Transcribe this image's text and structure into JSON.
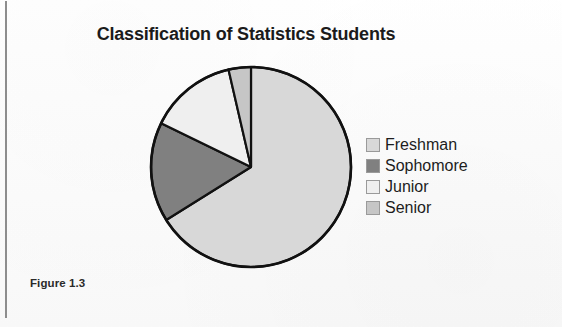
{
  "figure": {
    "caption": "Figure 1.3"
  },
  "chart_data": {
    "type": "pie",
    "title": "Classification of Statistics Students",
    "xlabel": "",
    "ylabel": "",
    "legend_position": "right",
    "grid": false,
    "start_angle_deg": 0,
    "direction": "clockwise",
    "categories": [
      "Freshman",
      "Sophomore",
      "Junior",
      "Senior"
    ],
    "values": [
      66.1,
      16.1,
      14.2,
      3.6
    ],
    "units": "percent",
    "slice_angles_deg": [
      238,
      58,
      51,
      13
    ],
    "colors": [
      "#d8d8d8",
      "#808080",
      "#efefef",
      "#c6c6c6"
    ],
    "slices": [
      {
        "label": "Freshman",
        "value": 66.1,
        "angle_deg": 238,
        "color": "#d8d8d8"
      },
      {
        "label": "Sophomore",
        "value": 16.1,
        "angle_deg": 58,
        "color": "#808080"
      },
      {
        "label": "Junior",
        "value": 14.2,
        "angle_deg": 51,
        "color": "#efefef"
      },
      {
        "label": "Senior",
        "value": 3.6,
        "angle_deg": 13,
        "color": "#c6c6c6"
      }
    ],
    "outline_color": "#111111"
  },
  "legend": {
    "items": [
      {
        "label": "Freshman",
        "color": "#d8d8d8"
      },
      {
        "label": "Sophomore",
        "color": "#808080"
      },
      {
        "label": "Junior",
        "color": "#efefef"
      },
      {
        "label": "Senior",
        "color": "#c6c6c6"
      }
    ]
  }
}
